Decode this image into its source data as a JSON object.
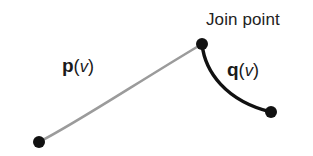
{
  "figure": {
    "background_color": "#ffffff",
    "width": 313,
    "height": 156
  },
  "labels": {
    "join_point": "Join point",
    "curve_p": {
      "name": "p",
      "open_paren": "(",
      "arg": "v",
      "close_paren": ")"
    },
    "curve_q": {
      "name": "q",
      "open_paren": "(",
      "arg": "v",
      "close_paren": ")"
    }
  },
  "chart_data": {
    "type": "line",
    "xlabel": "",
    "ylabel": "",
    "grid": false,
    "legend": "none",
    "xlim": [
      0,
      313
    ],
    "ylim": [
      156,
      0
    ],
    "series": [
      {
        "name": "p(v)",
        "label": "p(v)",
        "color": "#9b9b9b",
        "stroke_width": 2.6,
        "path": "M 39 142 C 75 124, 138 82, 202 44",
        "control_points": [
          [
            39,
            142
          ],
          [
            75,
            124
          ],
          [
            138,
            82
          ],
          [
            202,
            44
          ]
        ],
        "start_point": [
          39,
          142
        ],
        "end_point": [
          202,
          44
        ]
      },
      {
        "name": "q(v)",
        "label": "q(v)",
        "color": "#111111",
        "stroke_width": 3.4,
        "path": "M 202 44 C 205 72, 226 101, 271 112",
        "control_points": [
          [
            202,
            44
          ],
          [
            205,
            72
          ],
          [
            226,
            101
          ],
          [
            271,
            112
          ]
        ],
        "start_point": [
          202,
          44
        ],
        "end_point": [
          271,
          112
        ]
      }
    ],
    "markers": [
      {
        "name": "p-start-point",
        "x": 39,
        "y": 142,
        "radius": 6.0,
        "color": "#111111"
      },
      {
        "name": "join-point",
        "x": 202,
        "y": 44,
        "radius": 6.0,
        "color": "#111111"
      },
      {
        "name": "q-end-point",
        "x": 271,
        "y": 112,
        "radius": 6.0,
        "color": "#111111"
      }
    ],
    "annotations": [
      {
        "text": "Join point",
        "x": 206,
        "y": 11,
        "anchor": "start",
        "font_size": 17
      },
      {
        "text": "p(v)",
        "x": 62,
        "y": 56,
        "anchor": "start",
        "font_size": 19
      },
      {
        "text": "q(v)",
        "x": 227,
        "y": 60,
        "anchor": "start",
        "font_size": 19
      }
    ]
  },
  "colors": {
    "curve_p": "#9b9b9b",
    "curve_q": "#111111",
    "marker": "#111111",
    "text": "#222222",
    "background": "#ffffff"
  }
}
